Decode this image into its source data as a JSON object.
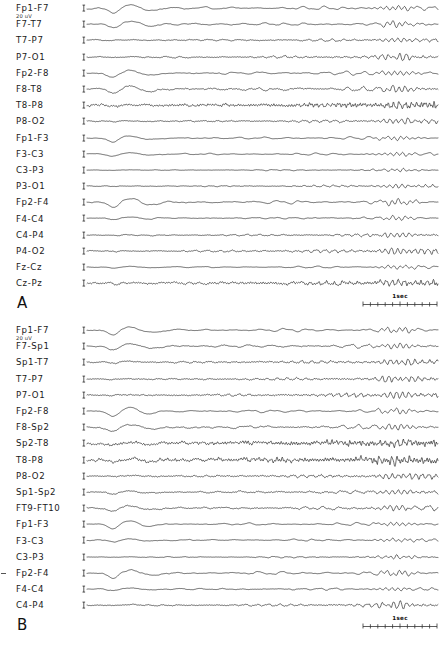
{
  "figure": {
    "calibration_label": "20 uV",
    "timescale_label": "1sec"
  },
  "panels": [
    {
      "letter": "A",
      "channels": [
        "Fp1-F7",
        "F7-T7",
        "T7-P7",
        "P7-O1",
        "Fp2-F8",
        "F8-T8",
        "T8-P8",
        "P8-O2",
        "Fp1-F3",
        "F3-C3",
        "C3-P3",
        "P3-O1",
        "Fp2-F4",
        "F4-C4",
        "C4-P4",
        "P4-O2",
        "Fz-Cz",
        "Cz-Pz"
      ]
    },
    {
      "letter": "B",
      "channels": [
        "Fp1-F7",
        "F7-Sp1",
        "Sp1-T7",
        "T7-P7",
        "P7-O1",
        "Fp2-F8",
        "F8-Sp2",
        "Sp2-T8",
        "T8-P8",
        "P8-O2",
        "Sp1-Sp2",
        "FT9-FT10",
        "Fp1-F3",
        "F3-C3",
        "C3-P3",
        "Fp2-F4",
        "F4-C4",
        "C4-P4"
      ]
    }
  ],
  "chart_data": {
    "type": "line",
    "title": "",
    "xlabel": "",
    "ylabel": "",
    "time_scale_seconds_per_marker": 1,
    "amplitude_calibration_uv": 20,
    "panels": [
      {
        "letter": "A",
        "series": [
          {
            "name": "Fp1-F7",
            "amplitude": 0.95,
            "baseFreq": 3.0,
            "noise": 0.1,
            "burst": 1.0,
            "evolve": 0.3,
            "dense": 0.0,
            "seed": 11
          },
          {
            "name": "F7-T7",
            "amplitude": 0.8,
            "baseFreq": 3.4,
            "noise": 0.16,
            "burst": 0.88,
            "evolve": 0.38,
            "dense": 0.0,
            "seed": 23
          },
          {
            "name": "T7-P7",
            "amplitude": 0.42,
            "baseFreq": 5.2,
            "noise": 0.22,
            "burst": 0.22,
            "evolve": 0.62,
            "dense": 0.25,
            "seed": 37
          },
          {
            "name": "P7-O1",
            "amplitude": 0.46,
            "baseFreq": 6.2,
            "noise": 0.2,
            "burst": 0.18,
            "evolve": 0.8,
            "dense": 0.3,
            "seed": 41
          },
          {
            "name": "Fp2-F8",
            "amplitude": 0.92,
            "baseFreq": 3.1,
            "noise": 0.12,
            "burst": 1.0,
            "evolve": 0.34,
            "dense": 0.0,
            "seed": 53
          },
          {
            "name": "F8-T8",
            "amplitude": 0.86,
            "baseFreq": 3.6,
            "noise": 0.2,
            "burst": 0.92,
            "evolve": 0.44,
            "dense": 0.15,
            "seed": 61
          },
          {
            "name": "T8-P8",
            "amplitude": 0.55,
            "baseFreq": 11.0,
            "noise": 0.42,
            "burst": 0.3,
            "evolve": 0.7,
            "dense": 0.85,
            "seed": 73
          },
          {
            "name": "P8-O2",
            "amplitude": 0.4,
            "baseFreq": 6.0,
            "noise": 0.24,
            "burst": 0.16,
            "evolve": 0.82,
            "dense": 0.35,
            "seed": 83
          },
          {
            "name": "Fp1-F3",
            "amplitude": 0.8,
            "baseFreq": 3.0,
            "noise": 0.1,
            "burst": 0.9,
            "evolve": 0.3,
            "dense": 0.0,
            "seed": 97
          },
          {
            "name": "F3-C3",
            "amplitude": 0.58,
            "baseFreq": 3.4,
            "noise": 0.12,
            "burst": 0.62,
            "evolve": 0.36,
            "dense": 0.0,
            "seed": 101
          },
          {
            "name": "C3-P3",
            "amplitude": 0.3,
            "baseFreq": 5.0,
            "noise": 0.14,
            "burst": 0.12,
            "evolve": 0.55,
            "dense": 0.1,
            "seed": 113
          },
          {
            "name": "P3-O1",
            "amplitude": 0.32,
            "baseFreq": 6.4,
            "noise": 0.16,
            "burst": 0.1,
            "evolve": 0.78,
            "dense": 0.2,
            "seed": 127
          },
          {
            "name": "Fp2-F4",
            "amplitude": 0.95,
            "baseFreq": 3.0,
            "noise": 0.12,
            "burst": 1.0,
            "evolve": 0.32,
            "dense": 0.0,
            "seed": 131
          },
          {
            "name": "F4-C4",
            "amplitude": 0.52,
            "baseFreq": 3.6,
            "noise": 0.14,
            "burst": 0.5,
            "evolve": 0.4,
            "dense": 0.05,
            "seed": 149
          },
          {
            "name": "C4-P4",
            "amplitude": 0.4,
            "baseFreq": 6.0,
            "noise": 0.16,
            "burst": 0.14,
            "evolve": 0.8,
            "dense": 0.25,
            "seed": 151
          },
          {
            "name": "P4-O2",
            "amplitude": 0.48,
            "baseFreq": 6.8,
            "noise": 0.18,
            "burst": 0.12,
            "evolve": 0.92,
            "dense": 0.32,
            "seed": 163
          },
          {
            "name": "Fz-Cz",
            "amplitude": 0.48,
            "baseFreq": 3.2,
            "noise": 0.12,
            "burst": 0.42,
            "evolve": 0.46,
            "dense": 0.05,
            "seed": 173
          },
          {
            "name": "Cz-Pz",
            "amplitude": 0.52,
            "baseFreq": 7.5,
            "noise": 0.4,
            "burst": 0.2,
            "evolve": 0.8,
            "dense": 0.7,
            "seed": 181
          }
        ]
      },
      {
        "letter": "B",
        "series": [
          {
            "name": "Fp1-F7",
            "amplitude": 0.92,
            "baseFreq": 3.0,
            "noise": 0.1,
            "burst": 1.0,
            "evolve": 0.32,
            "dense": 0.0,
            "seed": 211
          },
          {
            "name": "F7-Sp1",
            "amplitude": 0.85,
            "baseFreq": 3.3,
            "noise": 0.16,
            "burst": 0.92,
            "evolve": 0.4,
            "dense": 0.08,
            "seed": 223
          },
          {
            "name": "Sp1-T7",
            "amplitude": 0.5,
            "baseFreq": 6.5,
            "noise": 0.26,
            "burst": 0.3,
            "evolve": 0.72,
            "dense": 0.4,
            "seed": 227
          },
          {
            "name": "T7-P7",
            "amplitude": 0.44,
            "baseFreq": 7.0,
            "noise": 0.22,
            "burst": 0.18,
            "evolve": 0.86,
            "dense": 0.4,
            "seed": 229
          },
          {
            "name": "P7-O1",
            "amplitude": 0.46,
            "baseFreq": 7.6,
            "noise": 0.22,
            "burst": 0.14,
            "evolve": 0.95,
            "dense": 0.45,
            "seed": 233
          },
          {
            "name": "Fp2-F8",
            "amplitude": 0.9,
            "baseFreq": 3.0,
            "noise": 0.12,
            "burst": 1.0,
            "evolve": 0.32,
            "dense": 0.0,
            "seed": 239
          },
          {
            "name": "F8-Sp2",
            "amplitude": 0.86,
            "baseFreq": 3.5,
            "noise": 0.18,
            "burst": 0.95,
            "evolve": 0.4,
            "dense": 0.12,
            "seed": 241
          },
          {
            "name": "Sp2-T8",
            "amplitude": 0.6,
            "baseFreq": 13.0,
            "noise": 0.5,
            "burst": 0.35,
            "evolve": 0.6,
            "dense": 0.95,
            "seed": 251
          },
          {
            "name": "T8-P8",
            "amplitude": 0.62,
            "baseFreq": 12.0,
            "noise": 0.5,
            "burst": 0.3,
            "evolve": 0.7,
            "dense": 0.92,
            "seed": 257
          },
          {
            "name": "P8-O2",
            "amplitude": 0.45,
            "baseFreq": 7.0,
            "noise": 0.28,
            "burst": 0.18,
            "evolve": 0.85,
            "dense": 0.45,
            "seed": 263
          },
          {
            "name": "Sp1-Sp2",
            "amplitude": 0.58,
            "baseFreq": 4.0,
            "noise": 0.24,
            "burst": 0.6,
            "evolve": 0.5,
            "dense": 0.25,
            "seed": 269
          },
          {
            "name": "FT9-FT10",
            "amplitude": 0.72,
            "baseFreq": 3.6,
            "noise": 0.22,
            "burst": 0.8,
            "evolve": 0.46,
            "dense": 0.18,
            "seed": 271
          },
          {
            "name": "Fp1-F3",
            "amplitude": 0.82,
            "baseFreq": 3.0,
            "noise": 0.1,
            "burst": 0.92,
            "evolve": 0.3,
            "dense": 0.0,
            "seed": 277
          },
          {
            "name": "F3-C3",
            "amplitude": 0.55,
            "baseFreq": 3.6,
            "noise": 0.14,
            "burst": 0.58,
            "evolve": 0.4,
            "dense": 0.05,
            "seed": 281
          },
          {
            "name": "C3-P3",
            "amplitude": 0.34,
            "baseFreq": 5.4,
            "noise": 0.14,
            "burst": 0.14,
            "evolve": 0.6,
            "dense": 0.15,
            "seed": 283
          },
          {
            "name": "Fp2-F4",
            "amplitude": 0.95,
            "baseFreq": 3.0,
            "noise": 0.12,
            "burst": 1.0,
            "evolve": 0.32,
            "dense": 0.0,
            "seed": 293
          },
          {
            "name": "F4-C4",
            "amplitude": 0.5,
            "baseFreq": 3.8,
            "noise": 0.16,
            "burst": 0.48,
            "evolve": 0.44,
            "dense": 0.08,
            "seed": 307
          },
          {
            "name": "C4-P4",
            "amplitude": 0.46,
            "baseFreq": 6.4,
            "noise": 0.18,
            "burst": 0.16,
            "evolve": 0.9,
            "dense": 0.3,
            "seed": 311
          }
        ]
      }
    ]
  }
}
